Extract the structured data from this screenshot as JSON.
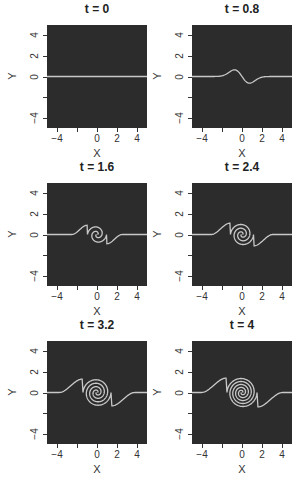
{
  "chart_data": [
    {
      "type": "line",
      "title": "t = 0",
      "t": 0,
      "xlabel": "X",
      "ylabel": "Y",
      "xlim": [
        -5,
        5
      ],
      "ylim": [
        -5,
        5
      ],
      "x_ticks": [
        "-4",
        "0",
        "2",
        "4"
      ],
      "y_ticks": [
        "4",
        "2",
        "0",
        "-4"
      ],
      "description": "Flat interface along y = 0"
    },
    {
      "type": "line",
      "title": "t = 0.8",
      "t": 0.8,
      "xlabel": "X",
      "ylabel": "Y",
      "xlim": [
        -5,
        5
      ],
      "ylim": [
        -5,
        5
      ],
      "x_ticks": [
        "-4",
        "0",
        "2",
        "4"
      ],
      "y_ticks": [
        "4",
        "2",
        "0",
        "-4"
      ],
      "description": "Interface begins to roll up; S-shaped wave near origin, amplitude ~0.7"
    },
    {
      "type": "line",
      "title": "t = 1.6",
      "t": 1.6,
      "xlabel": "X",
      "ylabel": "Y",
      "xlim": [
        -5,
        5
      ],
      "ylim": [
        -5,
        5
      ],
      "x_ticks": [
        "-4",
        "0",
        "2",
        "4"
      ],
      "y_ticks": [
        "4",
        "2",
        "0",
        "-4"
      ],
      "description": "Interface rolls into a spiral with ~1 turn centered at origin"
    },
    {
      "type": "line",
      "title": "t = 2.4",
      "t": 2.4,
      "xlabel": "X",
      "ylabel": "Y",
      "xlim": [
        -5,
        5
      ],
      "ylim": [
        -5,
        5
      ],
      "x_ticks": [
        "-4",
        "0",
        "2",
        "4"
      ],
      "y_ticks": [
        "4",
        "2",
        "0",
        "-4"
      ],
      "description": "Spiral with ~1.5 turns, outer radius ~1"
    },
    {
      "type": "line",
      "title": "t = 3.2",
      "t": 3.2,
      "xlabel": "X",
      "ylabel": "Y",
      "xlim": [
        -5,
        5
      ],
      "ylim": [
        -5,
        5
      ],
      "x_ticks": [
        "-4",
        "0",
        "2",
        "4"
      ],
      "y_ticks": [
        "4",
        "2",
        "0",
        "-4"
      ],
      "description": "Spiral with ~2 turns, outer radius ~1.3"
    },
    {
      "type": "line",
      "title": "t = 4",
      "t": 4,
      "xlabel": "X",
      "ylabel": "Y",
      "xlim": [
        -5,
        5
      ],
      "ylim": [
        -5,
        5
      ],
      "x_ticks": [
        "-4",
        "0",
        "2",
        "4"
      ],
      "y_ticks": [
        "4",
        "2",
        "0",
        "-4"
      ],
      "description": "Spiral with ~2.5 turns, outer radius ~1.4"
    }
  ],
  "panels": [
    {
      "title": "t = 0",
      "xlabel": "X",
      "ylabel": "Y"
    },
    {
      "title": "t = 0.8",
      "xlabel": "X",
      "ylabel": "Y"
    },
    {
      "title": "t = 1.6",
      "xlabel": "X",
      "ylabel": "Y"
    },
    {
      "title": "t = 2.4",
      "xlabel": "X",
      "ylabel": "Y"
    },
    {
      "title": "t = 3.2",
      "xlabel": "X",
      "ylabel": "Y"
    },
    {
      "title": "t = 4",
      "xlabel": "X",
      "ylabel": "Y"
    }
  ],
  "ticks": {
    "x": [
      "-4",
      "0",
      "2",
      "4"
    ],
    "y": [
      "4",
      "2",
      "0",
      "-4"
    ]
  },
  "colors": {
    "background": "#2c2c2c",
    "curve": "#c8c8c8"
  }
}
